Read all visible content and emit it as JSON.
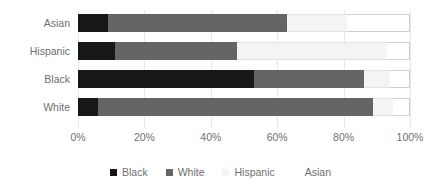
{
  "chart_data": {
    "type": "bar",
    "orientation": "horizontal",
    "stacked": true,
    "normalized": true,
    "title": "",
    "subtitle": "",
    "xlabel": "",
    "ylabel": "",
    "xlim": [
      0,
      100
    ],
    "xticks": [
      0,
      20,
      40,
      60,
      80,
      100
    ],
    "xtick_labels": [
      "0%",
      "20%",
      "40%",
      "60%",
      "80%",
      "100%"
    ],
    "grid": true,
    "grid_axis": "x",
    "legend_position": "bottom",
    "categories": [
      "Asian",
      "Hispanic",
      "Black",
      "White"
    ],
    "series": [
      {
        "name": "Black",
        "color": "#171717",
        "values": [
          9,
          11,
          53,
          6
        ]
      },
      {
        "name": "White",
        "color": "#656565",
        "values": [
          54,
          37,
          33,
          83
        ]
      },
      {
        "name": "Hispanic",
        "color": "#f4f4f4",
        "values": [
          18,
          45,
          8,
          6
        ]
      },
      {
        "name": "Asian",
        "color": "#ffffff",
        "values": [
          19,
          7,
          6,
          5
        ]
      }
    ],
    "cumulative_boundaries_pct": {
      "Asian": [
        9,
        63,
        81,
        100
      ],
      "Hispanic": [
        11,
        48,
        93,
        100
      ],
      "Black": [
        53,
        86,
        94,
        100
      ],
      "White": [
        6,
        89,
        95,
        100
      ]
    },
    "legend_entries": [
      {
        "label": "Black",
        "color": "#171717"
      },
      {
        "label": "White",
        "color": "#656565"
      },
      {
        "label": "Hispanic",
        "color": "#f4f4f4"
      },
      {
        "label": "Asian",
        "color": "#ffffff"
      }
    ]
  },
  "axis": {
    "y_labels": [
      "Asian",
      "Hispanic",
      "Black",
      "White"
    ],
    "x_labels": [
      "0%",
      "20%",
      "40%",
      "60%",
      "80%",
      "100%"
    ]
  },
  "legend": {
    "items": [
      {
        "label": "Black"
      },
      {
        "label": "White"
      },
      {
        "label": "Hispanic"
      },
      {
        "label": "Asian"
      }
    ]
  }
}
